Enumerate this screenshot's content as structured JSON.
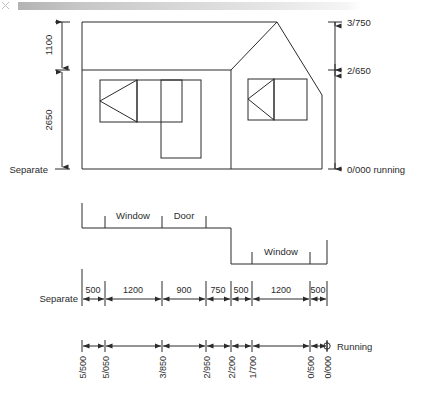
{
  "drawing": {
    "title": "Building elevation with separate and running dimensions",
    "line_color": "#2b2b2b",
    "text_color": "#2b2b2b"
  },
  "elevation": {
    "left_dimensions": [
      {
        "value": "1100",
        "name": "upper-height"
      },
      {
        "value": "2650",
        "name": "lower-height"
      }
    ],
    "left_datum_label": "Separate",
    "right_dimensions": [
      {
        "value": "3/750",
        "name": "ridge-level"
      },
      {
        "value": "2/650",
        "name": "eaves-level"
      },
      {
        "value": "0/000 running",
        "name": "ground-level"
      }
    ]
  },
  "plan": {
    "openings": [
      {
        "label": "Window",
        "name": "plan-window-left"
      },
      {
        "label": "Door",
        "name": "plan-door"
      },
      {
        "label": "Window",
        "name": "plan-window-right"
      }
    ]
  },
  "separate_dimensions": {
    "label": "Separate",
    "values": [
      "500",
      "1200",
      "900",
      "750",
      "500",
      "1200",
      "500"
    ]
  },
  "running_dimensions": {
    "label": "Running",
    "values": [
      "5/500",
      "5/050",
      "3/850",
      "2/950",
      "2/200",
      "1/700",
      "0/500",
      "0/000"
    ]
  }
}
